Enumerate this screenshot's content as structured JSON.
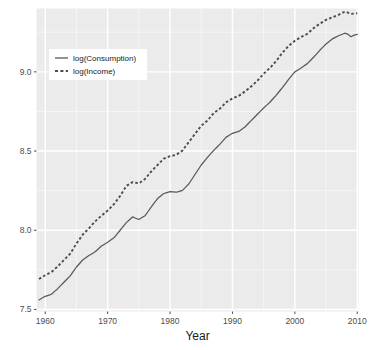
{
  "chart_data": {
    "type": "line",
    "title": "",
    "xlabel": "Year",
    "ylabel": "",
    "xlim": [
      1958.6,
      2010.2
    ],
    "ylim": [
      7.487,
      9.4
    ],
    "xticks": [
      1960,
      1970,
      1980,
      1990,
      2000,
      2010
    ],
    "xticklabels": [
      "1960",
      "1970",
      "1980",
      "1990",
      "2000",
      "2010"
    ],
    "yticks": [
      7.5,
      8.0,
      8.5,
      9.0
    ],
    "yticklabels": [
      "7.5",
      "8.0",
      "8.5",
      "9.0"
    ],
    "grid": true,
    "grid_major_color": "#ffffff",
    "grid_minor_color": "#f5f5f5",
    "panel_background": "#ebebeb",
    "plot_background": "#ffffff",
    "legend_position": "top-left-inside",
    "legend_background": "#ffffff",
    "series": [
      {
        "name": "log(Consumption)",
        "linestyle": "solid",
        "color": "#595959",
        "x": [
          1959.0,
          1959.5,
          1960.0,
          1960.5,
          1961.0,
          1961.5,
          1962.0,
          1962.5,
          1963.0,
          1963.5,
          1964.0,
          1964.5,
          1965.0,
          1965.5,
          1966.0,
          1966.5,
          1967.0,
          1967.5,
          1968.0,
          1968.5,
          1969.0,
          1969.5,
          1970.0,
          1970.5,
          1971.0,
          1971.5,
          1972.0,
          1972.5,
          1973.0,
          1973.5,
          1974.0,
          1974.5,
          1975.0,
          1975.5,
          1976.0,
          1976.5,
          1977.0,
          1977.5,
          1978.0,
          1978.5,
          1979.0,
          1979.5,
          1980.0,
          1980.5,
          1981.0,
          1981.5,
          1982.0,
          1982.5,
          1983.0,
          1983.5,
          1984.0,
          1984.5,
          1985.0,
          1985.5,
          1986.0,
          1986.5,
          1987.0,
          1987.5,
          1988.0,
          1988.5,
          1989.0,
          1989.5,
          1990.0,
          1990.5,
          1991.0,
          1991.5,
          1992.0,
          1992.5,
          1993.0,
          1993.5,
          1994.0,
          1994.5,
          1995.0,
          1995.5,
          1996.0,
          1996.5,
          1997.0,
          1997.5,
          1998.0,
          1998.5,
          1999.0,
          1999.5,
          2000.0,
          2000.5,
          2001.0,
          2001.5,
          2002.0,
          2002.5,
          2003.0,
          2003.5,
          2004.0,
          2004.5,
          2005.0,
          2005.5,
          2006.0,
          2006.5,
          2007.0,
          2007.5,
          2008.0,
          2008.5,
          2009.0,
          2009.5,
          2010.0
        ],
        "y": [
          7.56,
          7.572,
          7.583,
          7.589,
          7.596,
          7.614,
          7.631,
          7.652,
          7.672,
          7.692,
          7.712,
          7.74,
          7.768,
          7.79,
          7.812,
          7.826,
          7.84,
          7.852,
          7.864,
          7.882,
          7.9,
          7.912,
          7.924,
          7.938,
          7.952,
          7.976,
          8.0,
          8.024,
          8.048,
          8.066,
          8.084,
          8.076,
          8.068,
          8.08,
          8.092,
          8.12,
          8.148,
          8.174,
          8.2,
          8.216,
          8.232,
          8.238,
          8.244,
          8.242,
          8.24,
          8.246,
          8.252,
          8.272,
          8.292,
          8.322,
          8.352,
          8.382,
          8.412,
          8.436,
          8.46,
          8.482,
          8.504,
          8.524,
          8.544,
          8.566,
          8.588,
          8.6,
          8.612,
          8.618,
          8.624,
          8.638,
          8.652,
          8.672,
          8.692,
          8.712,
          8.732,
          8.752,
          8.772,
          8.79,
          8.808,
          8.83,
          8.852,
          8.876,
          8.9,
          8.926,
          8.952,
          8.976,
          9.0,
          9.012,
          9.024,
          9.038,
          9.052,
          9.072,
          9.092,
          9.114,
          9.136,
          9.156,
          9.176,
          9.192,
          9.208,
          9.218,
          9.228,
          9.236,
          9.244,
          9.238,
          9.222,
          9.232,
          9.236
        ]
      },
      {
        "name": "log(Income)",
        "linestyle": "dashed",
        "color": "#4d4d4d",
        "x": [
          1959.0,
          1959.5,
          1960.0,
          1960.5,
          1961.0,
          1961.5,
          1962.0,
          1962.5,
          1963.0,
          1963.5,
          1964.0,
          1964.5,
          1965.0,
          1965.5,
          1966.0,
          1966.5,
          1967.0,
          1967.5,
          1968.0,
          1968.5,
          1969.0,
          1969.5,
          1970.0,
          1970.5,
          1971.0,
          1971.5,
          1972.0,
          1972.5,
          1973.0,
          1973.5,
          1974.0,
          1974.5,
          1975.0,
          1975.5,
          1976.0,
          1976.5,
          1977.0,
          1977.5,
          1978.0,
          1978.5,
          1979.0,
          1979.5,
          1980.0,
          1980.5,
          1981.0,
          1981.5,
          1982.0,
          1982.5,
          1983.0,
          1983.5,
          1984.0,
          1984.5,
          1985.0,
          1985.5,
          1986.0,
          1986.5,
          1987.0,
          1987.5,
          1988.0,
          1988.5,
          1989.0,
          1989.5,
          1990.0,
          1990.5,
          1991.0,
          1991.5,
          1992.0,
          1992.5,
          1993.0,
          1993.5,
          1994.0,
          1994.5,
          1995.0,
          1995.5,
          1996.0,
          1996.5,
          1997.0,
          1997.5,
          1998.0,
          1998.5,
          1999.0,
          1999.5,
          2000.0,
          2000.5,
          2001.0,
          2001.5,
          2002.0,
          2002.5,
          2003.0,
          2003.5,
          2004.0,
          2004.5,
          2005.0,
          2005.5,
          2006.0,
          2006.5,
          2007.0,
          2007.5,
          2008.0,
          2008.5,
          2009.0,
          2009.5,
          2010.0
        ],
        "y": [
          7.692,
          7.704,
          7.716,
          7.726,
          7.736,
          7.754,
          7.772,
          7.792,
          7.812,
          7.832,
          7.852,
          7.884,
          7.916,
          7.944,
          7.972,
          7.992,
          8.012,
          8.034,
          8.056,
          8.074,
          8.092,
          8.108,
          8.124,
          8.144,
          8.164,
          8.19,
          8.216,
          8.248,
          8.28,
          8.292,
          8.304,
          8.3,
          8.296,
          8.31,
          8.324,
          8.348,
          8.372,
          8.392,
          8.412,
          8.432,
          8.452,
          8.46,
          8.468,
          8.472,
          8.476,
          8.49,
          8.504,
          8.53,
          8.556,
          8.582,
          8.608,
          8.634,
          8.66,
          8.676,
          8.692,
          8.716,
          8.74,
          8.754,
          8.768,
          8.788,
          8.808,
          8.82,
          8.832,
          8.84,
          8.848,
          8.862,
          8.876,
          8.892,
          8.908,
          8.926,
          8.944,
          8.966,
          8.988,
          9.006,
          9.024,
          9.046,
          9.068,
          9.094,
          9.12,
          9.142,
          9.164,
          9.18,
          9.196,
          9.208,
          9.22,
          9.23,
          9.24,
          9.258,
          9.276,
          9.29,
          9.304,
          9.316,
          9.328,
          9.336,
          9.344,
          9.352,
          9.36,
          9.37,
          9.38,
          9.374,
          9.366,
          9.368,
          9.37
        ]
      }
    ]
  },
  "axis": {
    "x_title": "Year"
  },
  "legend": {
    "items": [
      {
        "label": "log(Consumption)",
        "style": "solid"
      },
      {
        "label": "log(Income)",
        "style": "dashed"
      }
    ]
  }
}
